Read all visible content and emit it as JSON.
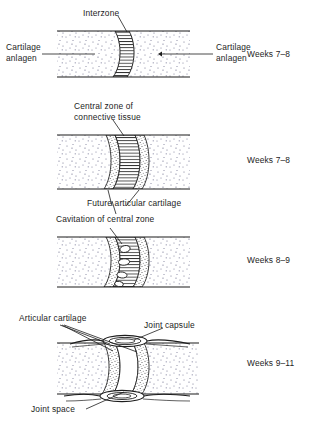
{
  "figure": {
    "background": "#ffffff",
    "ink": "#1d1d1d"
  },
  "panels": [
    {
      "id": "panel-1",
      "stage_label": "Weeks 7–8",
      "annotations": [
        {
          "name": "interzone",
          "text": "Interzone"
        },
        {
          "name": "cartilage-anlagen-left",
          "text": "Cartilage\nanlagen"
        },
        {
          "name": "cartilage-anlagen-right",
          "text": "Cartilage\nanlagen"
        }
      ]
    },
    {
      "id": "panel-2",
      "stage_label": "Weeks 7–8",
      "annotations": [
        {
          "name": "central-zone-connective-tissue",
          "text": "Central zone of\nconnective tissue"
        },
        {
          "name": "future-articular-cartilage",
          "text": "Future articular cartilage"
        }
      ]
    },
    {
      "id": "panel-3",
      "stage_label": "Weeks 8–9",
      "annotations": [
        {
          "name": "cavitation-of-central-zone",
          "text": "Cavitation of central zone"
        }
      ]
    },
    {
      "id": "panel-4",
      "stage_label": "Weeks 9–11",
      "annotations": [
        {
          "name": "articular-cartilage",
          "text": "Articular cartilage"
        },
        {
          "name": "joint-capsule",
          "text": "Joint capsule"
        },
        {
          "name": "joint-space",
          "text": "Joint space"
        }
      ]
    }
  ],
  "labels": {
    "interzone": "Interzone",
    "cartilage_anlagen_left_line1": "Cartilage",
    "cartilage_anlagen_left_line2": "anlagen",
    "cartilage_anlagen_right_line1": "Cartilage",
    "cartilage_anlagen_right_line2": "anlagen",
    "central_zone_line1": "Central zone of",
    "central_zone_line2": "connective tissue",
    "future_articular_cartilage": "Future articular cartilage",
    "cavitation_of_central_zone": "Cavitation of central zone",
    "articular_cartilage": "Articular cartilage",
    "joint_capsule": "Joint capsule",
    "joint_space": "Joint space"
  },
  "stages": {
    "weeks_1": "Weeks 7–8",
    "weeks_2": "Weeks 7–8",
    "weeks_3": "Weeks 8–9",
    "weeks_4": "Weeks 9–11"
  }
}
